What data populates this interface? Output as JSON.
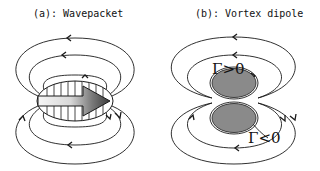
{
  "panels": {
    "a": {
      "title": "(a): Wavepacket",
      "description": "Wavepacket with striped elliptical envelope and rightward arrow, surrounded by dipolar field lines"
    },
    "b": {
      "title": "(b): Vortex dipole",
      "description": "Pair of counter-rotating vortices (gray ellipses) with surrounding circulation streamlines",
      "labels": {
        "upper_vortex": "Γ>0",
        "lower_vortex": "Γ<0"
      }
    }
  },
  "colors": {
    "line": "#1a1a1a",
    "vortex_fill": "#8a8a8a",
    "arrow_dark": "#444444",
    "arrow_light": "#f4f4f4"
  }
}
